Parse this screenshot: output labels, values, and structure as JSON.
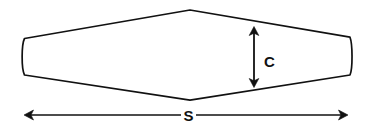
{
  "figure": {
    "type": "engineering-dimension-diagram",
    "background_color": "#ffffff",
    "line_color": "#111111",
    "line_width": 1.6
  },
  "shape": {
    "name": "wing-planform-outline",
    "fill": "#ffffff",
    "stroke": "#111111",
    "apex_top": {
      "x": 190,
      "y": 10
    },
    "apex_bottom": {
      "x": 190,
      "y": 100
    },
    "left_tip": {
      "x": 23,
      "y_top": 38,
      "y_bottom": 75
    },
    "right_tip": {
      "x": 351,
      "y_top": 37,
      "y_bottom": 75
    }
  },
  "dimensions": [
    {
      "id": "chord",
      "label": "C",
      "orientation": "vertical",
      "arrow_style": "double-headed",
      "label_position": "right-of-arrow",
      "arrow": {
        "x": 254,
        "y_start": 27,
        "y_end": 87
      },
      "label_point": {
        "x": 264,
        "y": 62
      }
    },
    {
      "id": "span",
      "label": "S",
      "orientation": "horizontal",
      "arrow_style": "double-headed",
      "label_position": "center-on-line",
      "arrow": {
        "y": 115,
        "x_start": 24,
        "x_end": 348
      },
      "label_point": {
        "x": 188,
        "y": 120
      }
    }
  ]
}
